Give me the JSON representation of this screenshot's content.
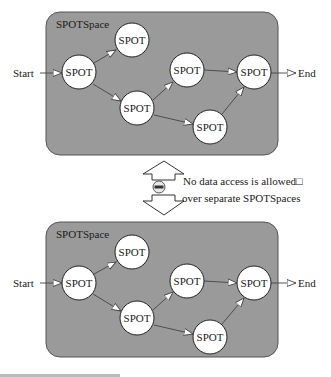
{
  "spaces": [
    {
      "id": "top",
      "label": "SPOTSpace",
      "start_label": "Start",
      "end_label": "End",
      "nodes": [
        {
          "id": "n1",
          "label": "SPOT"
        },
        {
          "id": "n2",
          "label": "SPOT"
        },
        {
          "id": "n3",
          "label": "SPOT"
        },
        {
          "id": "n4",
          "label": "SPOT"
        },
        {
          "id": "n5",
          "label": "SPOT"
        },
        {
          "id": "n6",
          "label": "SPOT"
        }
      ],
      "edges": [
        [
          "start",
          "n1"
        ],
        [
          "n1",
          "n2"
        ],
        [
          "n1",
          "n4"
        ],
        [
          "n4",
          "n3"
        ],
        [
          "n4",
          "n6"
        ],
        [
          "n3",
          "n5"
        ],
        [
          "n6",
          "n5"
        ],
        [
          "n5",
          "end"
        ]
      ]
    },
    {
      "id": "bottom",
      "label": "SPOTSpace",
      "start_label": "Start",
      "end_label": "End",
      "nodes": [
        {
          "id": "n1",
          "label": "SPOT"
        },
        {
          "id": "n2",
          "label": "SPOT"
        },
        {
          "id": "n3",
          "label": "SPOT"
        },
        {
          "id": "n4",
          "label": "SPOT"
        },
        {
          "id": "n5",
          "label": "SPOT"
        },
        {
          "id": "n6",
          "label": "SPOT"
        }
      ],
      "edges": [
        [
          "start",
          "n1"
        ],
        [
          "n1",
          "n2"
        ],
        [
          "n1",
          "n4"
        ],
        [
          "n4",
          "n3"
        ],
        [
          "n4",
          "n6"
        ],
        [
          "n3",
          "n5"
        ],
        [
          "n6",
          "n5"
        ],
        [
          "n5",
          "end"
        ]
      ]
    }
  ],
  "separator": {
    "note_line1": "No data access is allowed□",
    "note_line2": "over separate SPOTSpaces",
    "icon": "no-entry-icon"
  },
  "colors": {
    "space_fill": "#9a9a9a",
    "space_border": "#555555",
    "node_fill": "#ffffff",
    "node_border": "#222222",
    "edge": "#444444"
  }
}
